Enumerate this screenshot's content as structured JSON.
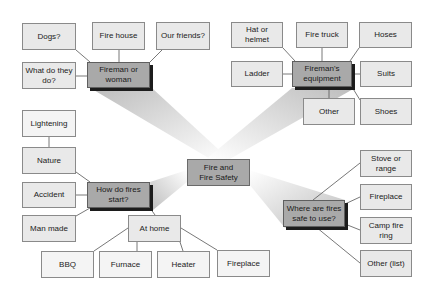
{
  "diagram": {
    "title": "Fire and Fire Safety",
    "center": {
      "label": "Fire and\nFire Safety"
    },
    "branches": [
      {
        "id": "fireman",
        "hub": "Fireman or woman",
        "children": [
          "Dogs?",
          "Fire house",
          "Our friends?",
          "What do they do?"
        ]
      },
      {
        "id": "equipment",
        "hub": "Fireman's equipment",
        "children": [
          "Hat or helmet",
          "Fire truck",
          "Hoses",
          "Ladder",
          "Suits",
          "Other",
          "Shoes"
        ]
      },
      {
        "id": "start",
        "hub": "How do fires start?",
        "children": [
          {
            "label": "Nature",
            "children": [
              "Lightening"
            ]
          },
          {
            "label": "Accident"
          },
          {
            "label": "Man made"
          },
          {
            "label": "At home",
            "children": [
              "BBQ",
              "Furnace",
              "Heater",
              "Fireplace"
            ]
          }
        ]
      },
      {
        "id": "safe",
        "hub": "Where are fires safe to use?",
        "children": [
          "Stove or range",
          "Fireplace",
          "Camp fire ring",
          "Other (list)"
        ]
      }
    ]
  },
  "nodes": {
    "center": "Fire and Fire Safety",
    "fireman_hub": "Fireman or woman",
    "dogs": "Dogs?",
    "fire_house": "Fire house",
    "our_friends": "Our friends?",
    "what_do": "What do they do?",
    "equip_hub": "Fireman's equipment",
    "hat": "Hat or helmet",
    "fire_truck": "Fire truck",
    "hoses": "Hoses",
    "ladder": "Ladder",
    "suits": "Suits",
    "other_equip": "Other",
    "shoes": "Shoes",
    "start_hub": "How do fires start?",
    "lightening": "Lightening",
    "nature": "Nature",
    "accident": "Accident",
    "man_made": "Man made",
    "at_home": "At home",
    "bbq": "BBQ",
    "furnace": "Furnace",
    "heater": "Heater",
    "fireplace_home": "Fireplace",
    "safe_hub": "Where are fires safe to use?",
    "stove": "Stove or range",
    "fireplace_safe": "Fireplace",
    "camp_fire": "Camp fire ring",
    "other_list": "Other (list)"
  },
  "colors": {
    "leaf_fill": "#e9e9e9",
    "hub_fill": "#a9a9a9",
    "hub_shadow": "#1c1c1c",
    "border": "#8a8a8a",
    "connector": "#555555",
    "beam": "#d0d0d0"
  }
}
